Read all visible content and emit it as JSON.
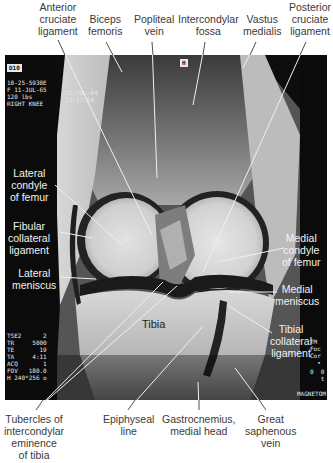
{
  "figure": {
    "labels_top": [
      {
        "id": "anterior-cruciate-ligament",
        "text": "Anterior\ncruciate\nligament"
      },
      {
        "id": "biceps-femoris",
        "text": "Biceps\nfemoris"
      },
      {
        "id": "popliteal-vein",
        "text": "Popliteal\nvein"
      },
      {
        "id": "intercondylar-fossa",
        "text": "Intercondylar\nfossa"
      },
      {
        "id": "vastus-medialis",
        "text": "Vastus\nmedialis"
      },
      {
        "id": "posterior-cruciate-ligament",
        "text": "Posterior\ncruciate\nligament"
      }
    ],
    "labels_left": [
      {
        "id": "lateral-condyle-of-femur",
        "text": "Lateral\ncondyle\nof femur"
      },
      {
        "id": "fibular-collateral-ligament",
        "text": "Fibular\ncollateral\nligament"
      },
      {
        "id": "lateral-meniscus",
        "text": "Lateral\nmeniscus"
      }
    ],
    "labels_right": [
      {
        "id": "medial-condyle-of-femur",
        "text": "Medial\ncondyle\nof femur"
      },
      {
        "id": "medial-meniscus",
        "text": "Medial\nmeniscus"
      },
      {
        "id": "tibial-collateral-ligament",
        "text": "Tibial\ncollateral\nligament"
      }
    ],
    "labels_inner": [
      {
        "id": "tibia",
        "text": "Tibia"
      }
    ],
    "labels_bottom": [
      {
        "id": "tubercles-of-intercondylar-eminence",
        "text": "Tubercles of\nintercondylar\neminence\nof tibia"
      },
      {
        "id": "epiphyseal-line",
        "text": "Epiphyseal\nline"
      },
      {
        "id": "gastrocnemius-medial-head",
        "text": "Gastrocnemius,\nmedial head"
      },
      {
        "id": "great-saphenous-vein",
        "text": "Great\nsaphenous\nvein"
      }
    ]
  },
  "scanner_overlay": {
    "series_tag": "D10",
    "orientation_tag": "H",
    "patient_info": "10-25-5930E\nF 11-JUL-65\n120 lbs\nRIGHT KNEE",
    "scan_date": "11-JUL-94\n13:17:54",
    "params": "TSE2      2\nTR     5000\nTE       19\nTA     4:11\nACQ       1\nFOV   180.0\nH 240*256 o",
    "right_params": "TM\nFoc\nCor\n  •",
    "right_values": "0  0\n   t",
    "machine": "MAGNETOM"
  }
}
